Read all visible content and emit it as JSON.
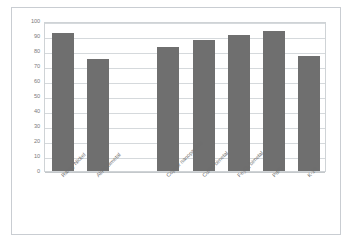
{
  "chart_data": {
    "type": "bar",
    "title": "",
    "subtitle": "",
    "xlabel": "",
    "ylabel": "",
    "categories": [
      "Raney Nickel",
      "Al/Pd bimetal",
      "",
      "Copper nanoparticle",
      "Cu/Pd bimetal",
      "Fe3O4 bimetal",
      "Pd/C",
      "K-10"
    ],
    "values": [
      92,
      75,
      null,
      83,
      87.5,
      91,
      93.5,
      76.5
    ],
    "ylim": [
      0,
      100
    ],
    "yticks": [
      0,
      10,
      20,
      30,
      40,
      50,
      60,
      70,
      80,
      90,
      100
    ],
    "ytick_labels": [
      "0",
      "10",
      "20",
      "30",
      "40",
      "50",
      "60",
      "70",
      "80",
      "90",
      "100"
    ],
    "grid": true,
    "legend": false,
    "legend_position": "none",
    "bar_color": "#6f6f6f",
    "gridline_color": "#d5d9dc",
    "axis_text_color": "#7a7a7a",
    "plot_border_color": "#cfd3d6",
    "frame_border_color": "#c9cdd2",
    "background_color": "#ffffff"
  },
  "x_labels": [
    {
      "text": "Raney Nickel",
      "sub": ""
    },
    {
      "text": "Al/Pd bimetal",
      "sub": ""
    },
    {
      "text": "Copper nanoparticle",
      "sub": ""
    },
    {
      "text": "Cu/Pd bimetal",
      "sub": ""
    },
    {
      "text": "Fe",
      "sub": "3O4 bimetal"
    },
    {
      "text": "Pd/C",
      "sub": ""
    },
    {
      "text": "K-10",
      "sub": ""
    }
  ]
}
